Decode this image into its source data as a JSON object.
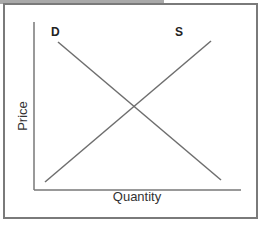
{
  "diagram": {
    "title": "",
    "y_axis_label": "Price",
    "x_axis_label": "Quantity",
    "curves": [
      {
        "name": "D",
        "label": "D",
        "type": "demand",
        "from": [
          58,
          42
        ],
        "to": [
          221,
          180
        ]
      },
      {
        "name": "S",
        "label": "S",
        "type": "supply",
        "from": [
          45,
          182
        ],
        "to": [
          211,
          41
        ]
      }
    ],
    "colors": {
      "frame": "#7a7a7a",
      "axis": "#777777",
      "curve": "#6e6e6e",
      "top_strip": "#a9a9a9"
    }
  }
}
